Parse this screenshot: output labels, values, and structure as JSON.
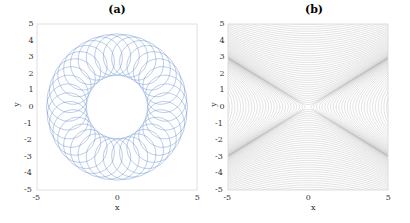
{
  "chart_data": [
    {
      "type": "line",
      "title": "(a)",
      "xlabel": "x",
      "ylabel": "y",
      "xlim": [
        -5,
        5
      ],
      "ylim": [
        -5,
        5
      ],
      "xticks": [
        "-5",
        "0",
        "5"
      ],
      "yticks": [
        "5",
        "4",
        "3",
        "2",
        "1",
        "0",
        "-1",
        "-2",
        "-3",
        "-4",
        "-5"
      ],
      "grid": false,
      "description": "Spirograph-like looping trajectory (epitrochoid) forming an annulus centered at origin",
      "outer_radius": 4.4,
      "inner_radius": 1.9,
      "line_color": "#4a78c2",
      "series": [
        {
          "name": "trajectory",
          "R": 3.15,
          "r": 1.25,
          "loops": 37
        }
      ]
    },
    {
      "type": "contour",
      "title": "(b)",
      "xlabel": "x",
      "ylabel": "y",
      "xlim": [
        -5,
        5
      ],
      "ylim": [
        -5,
        5
      ],
      "xticks": [
        "-5",
        "0",
        "5"
      ],
      "yticks": [
        "5",
        "4",
        "3",
        "2",
        "1",
        "0",
        "-1",
        "-2",
        "-3",
        "-4",
        "-5"
      ],
      "grid": false,
      "description": "Dense grey contour lines with saddle point at origin (hyperbolic level sets)",
      "line_color": "#b8b8b8"
    }
  ],
  "panels": {
    "a": {
      "title": "(a)",
      "xlabel": "x",
      "ylabel": "y"
    },
    "b": {
      "title": "(b)",
      "xlabel": "x",
      "ylabel": "y"
    }
  }
}
